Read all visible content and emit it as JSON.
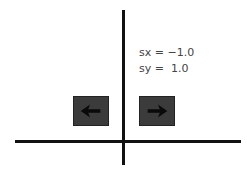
{
  "diagram": {
    "labels": {
      "sx": "sx = −1.0",
      "sy": "sy =  1.0"
    },
    "original_icon": "arrow-right-icon",
    "reflected_icon": "arrow-left-icon",
    "colors": {
      "axis": "#111111",
      "box": "#3b3b3b",
      "arrow": "#0a0a0a",
      "text": "#444444"
    }
  }
}
